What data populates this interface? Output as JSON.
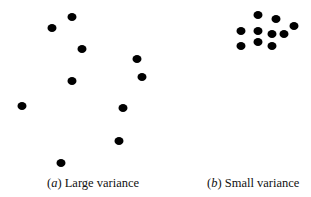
{
  "figure": {
    "panels": [
      {
        "id": "a",
        "label_prefix": "(",
        "label_letter": "a",
        "label_suffix": ")",
        "caption": "Large variance",
        "caption_x": 47,
        "dots": [
          [
            72,
            17
          ],
          [
            52,
            28
          ],
          [
            82,
            49
          ],
          [
            137,
            59
          ],
          [
            142,
            77
          ],
          [
            72,
            81
          ],
          [
            22,
            106
          ],
          [
            123,
            108
          ],
          [
            119,
            141
          ],
          [
            61,
            163
          ]
        ]
      },
      {
        "id": "b",
        "label_prefix": "(",
        "label_letter": "b",
        "label_suffix": ")",
        "caption": "Small variance",
        "caption_x": 207,
        "dots": [
          [
            258,
            15
          ],
          [
            276,
            19
          ],
          [
            294,
            26
          ],
          [
            241,
            31
          ],
          [
            258,
            31
          ],
          [
            272,
            34
          ],
          [
            284,
            34
          ],
          [
            258,
            42
          ],
          [
            241,
            46
          ],
          [
            272,
            46
          ]
        ]
      }
    ],
    "dot_color": "#000000"
  }
}
